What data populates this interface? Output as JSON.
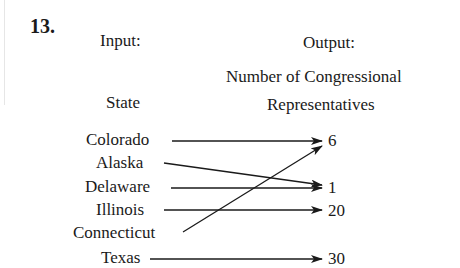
{
  "problem": {
    "number": "13.",
    "input_heading": "Input:",
    "output_heading": "Output:",
    "input_label": "State",
    "output_label_line1": "Number of Congressional",
    "output_label_line2": "Representatives"
  },
  "inputs": [
    {
      "state": "Colorado"
    },
    {
      "state": "Alaska"
    },
    {
      "state": "Delaware"
    },
    {
      "state": "Illinois"
    },
    {
      "state": "Connecticut"
    },
    {
      "state": "Texas"
    }
  ],
  "outputs": [
    {
      "value": "6"
    },
    {
      "value": "1"
    },
    {
      "value": "20"
    },
    {
      "value": "30"
    }
  ],
  "mappings": [
    {
      "from": "Colorado",
      "to": "6"
    },
    {
      "from": "Alaska",
      "to": "1"
    },
    {
      "from": "Delaware",
      "to": "1"
    },
    {
      "from": "Illinois",
      "to": "20"
    },
    {
      "from": "Connecticut",
      "to": "6"
    },
    {
      "from": "Texas",
      "to": "30"
    }
  ],
  "colors": {
    "ink": "#1a1a1a",
    "background": "#ffffff"
  }
}
